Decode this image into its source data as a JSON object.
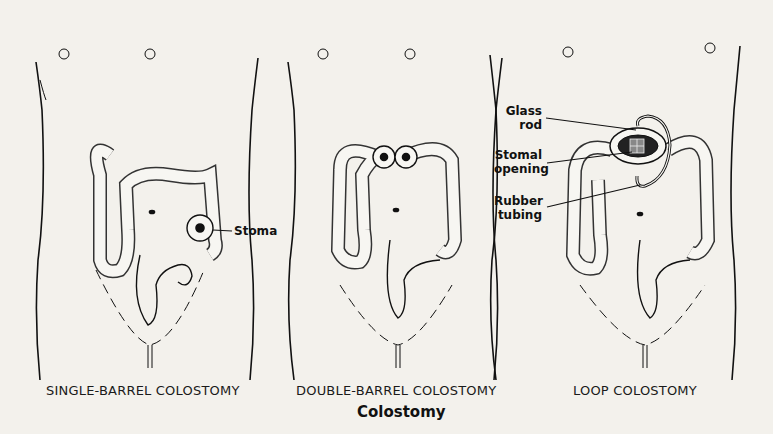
{
  "figure": {
    "title": "Colostomy",
    "panels": [
      {
        "caption": "SINGLE-BARREL COLOSTOMY",
        "labels": [
          "Stoma"
        ]
      },
      {
        "caption": "DOUBLE-BARREL COLOSTOMY",
        "labels": []
      },
      {
        "caption": "LOOP COLOSTOMY",
        "labels": [
          "Glass rod",
          "Stomal opening",
          "Rubber tubing"
        ]
      }
    ],
    "label_lines": {
      "stoma": "Stoma",
      "glass_rod_1": "Glass",
      "glass_rod_2": "rod",
      "stomal_opening_1": "Stomal",
      "stomal_opening_2": "opening",
      "rubber_tubing_1": "Rubber",
      "rubber_tubing_2": "tubing"
    }
  }
}
